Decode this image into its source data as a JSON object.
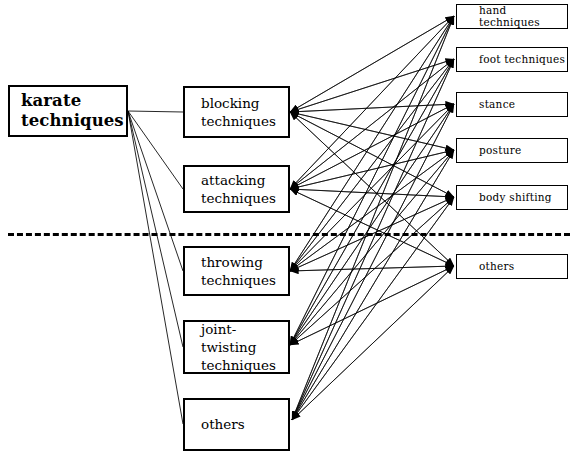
{
  "diagram": {
    "background_color": "#ffffff",
    "line_color": "#000000",
    "root": {
      "id": "root",
      "label": "karate\ntechniques",
      "x": 8,
      "y": 85,
      "w": 120,
      "h": 52
    },
    "middle_nodes": [
      {
        "id": "blocking",
        "label": "blocking\ntechniques",
        "x": 183,
        "y": 86,
        "w": 107,
        "h": 52
      },
      {
        "id": "attacking",
        "label": "attacking\ntechniques",
        "x": 183,
        "y": 165,
        "w": 107,
        "h": 48
      },
      {
        "id": "throwing",
        "label": "throwing\ntechniques",
        "x": 183,
        "y": 246,
        "w": 107,
        "h": 50
      },
      {
        "id": "joint-twisting",
        "label": "joint-twisting\ntechniques",
        "x": 183,
        "y": 320,
        "w": 107,
        "h": 54
      },
      {
        "id": "others-mid",
        "label": "others",
        "x": 183,
        "y": 398,
        "w": 107,
        "h": 53
      }
    ],
    "leaf_nodes": [
      {
        "id": "hand",
        "label": "hand techniques",
        "x": 456,
        "y": 4,
        "w": 112,
        "h": 25
      },
      {
        "id": "foot",
        "label": "foot techniques",
        "x": 456,
        "y": 47,
        "w": 112,
        "h": 25
      },
      {
        "id": "stance",
        "label": "stance",
        "x": 456,
        "y": 92,
        "w": 112,
        "h": 25
      },
      {
        "id": "posture",
        "label": "posture",
        "x": 456,
        "y": 138,
        "w": 112,
        "h": 25
      },
      {
        "id": "body-shifting",
        "label": "body shifting",
        "x": 456,
        "y": 185,
        "w": 112,
        "h": 25
      },
      {
        "id": "others-leaf",
        "label": "others",
        "x": 456,
        "y": 254,
        "w": 112,
        "h": 25
      }
    ],
    "divider": {
      "label": "dashed-separator-line",
      "x": 8,
      "y": 233,
      "w": 562
    },
    "root_edges": [
      {
        "from": "root",
        "to": "blocking"
      },
      {
        "from": "root",
        "to": "attacking"
      },
      {
        "from": "root",
        "to": "throwing"
      },
      {
        "from": "root",
        "to": "joint-twisting"
      },
      {
        "from": "root",
        "to": "others-mid"
      }
    ],
    "mesh_edges_note": "every middle node connects to every leaf node, arrows on both ends",
    "mesh_from": [
      "blocking",
      "attacking",
      "throwing",
      "joint-twisting",
      "others-mid"
    ],
    "mesh_to": [
      "hand",
      "foot",
      "stance",
      "posture",
      "body-shifting",
      "others-leaf"
    ],
    "anchors": {
      "root_out": {
        "x": 128,
        "y": 111
      },
      "mid_in": [
        {
          "x": 290,
          "y": 112
        },
        {
          "x": 290,
          "y": 189
        },
        {
          "x": 290,
          "y": 271
        },
        {
          "x": 290,
          "y": 345
        },
        {
          "x": 292,
          "y": 420
        }
      ],
      "mid_left": [
        {
          "x": 183,
          "y": 112
        },
        {
          "x": 183,
          "y": 189
        },
        {
          "x": 183,
          "y": 271
        },
        {
          "x": 183,
          "y": 347
        },
        {
          "x": 183,
          "y": 424
        }
      ],
      "leaf_in": [
        {
          "x": 454,
          "y": 16
        },
        {
          "x": 454,
          "y": 59
        },
        {
          "x": 454,
          "y": 104
        },
        {
          "x": 454,
          "y": 150
        },
        {
          "x": 454,
          "y": 197
        },
        {
          "x": 454,
          "y": 266
        }
      ]
    }
  }
}
